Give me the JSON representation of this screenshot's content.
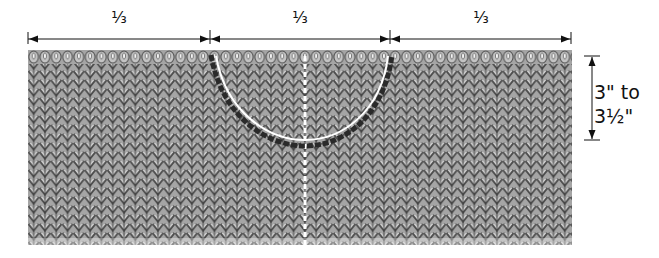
{
  "diagram": {
    "segments": [
      {
        "label": "1/3",
        "display": "⅓"
      },
      {
        "label": "1/3",
        "display": "⅓"
      },
      {
        "label": "1/3",
        "display": "⅓"
      }
    ],
    "height_label": {
      "line1": "3\" to",
      "line2": "3½\""
    },
    "colors": {
      "fabric": "#a9a9a9",
      "stitch_dark": "#4a4a4a",
      "stitch_light": "#c8c8c8",
      "curve_dark": "#2a2a2a",
      "curve_highlight": "#ffffff",
      "dimension_line": "#111111"
    }
  }
}
